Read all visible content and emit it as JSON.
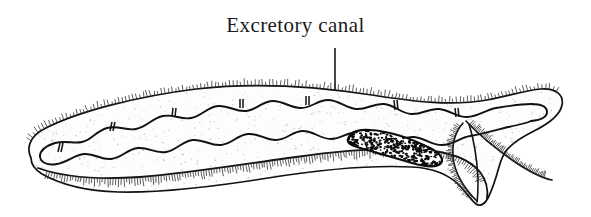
{
  "figure": {
    "kind": "biological-line-drawing",
    "background_color": "#ffffff",
    "ink_color": "#111111",
    "annotation": {
      "label": "Excretory canal",
      "label_color": "#1a1a1a",
      "leader": {
        "type": "arrow",
        "orientation": "vertical",
        "x": 335,
        "y_start": 48,
        "y_end": 118
      }
    },
    "parts": [
      {
        "name": "body-outline",
        "label": "Body outline",
        "description": "Elongate curved body, blunt rounded anterior at left, flaring lobed posterior at right"
      },
      {
        "name": "excretory-canal",
        "label": "Excretory canal",
        "description": "Paired wavy longitudinal tubes running just below the dorsal margin, looped closed at both ends"
      },
      {
        "name": "canal-cross-connective",
        "label": "Transverse connective",
        "description": "Short ladder-like bars joining the canal to the dorsal body wall"
      },
      {
        "name": "stippled-organ",
        "label": "Stippled organ",
        "description": "Elongate bean-shaped densely stippled body in the posterior half"
      },
      {
        "name": "ventral-margin",
        "label": "Ventral margin",
        "description": "Lower body edge fringed with fine cilia"
      },
      {
        "name": "posterior-lobe",
        "label": "Posterior lobe",
        "description": "Broad tail fan tapering to a ventral point"
      },
      {
        "name": "cilia-fringe",
        "label": "Cilia",
        "description": "Fine hair-like projections along the dorsal, ventral and tail margins"
      }
    ]
  }
}
